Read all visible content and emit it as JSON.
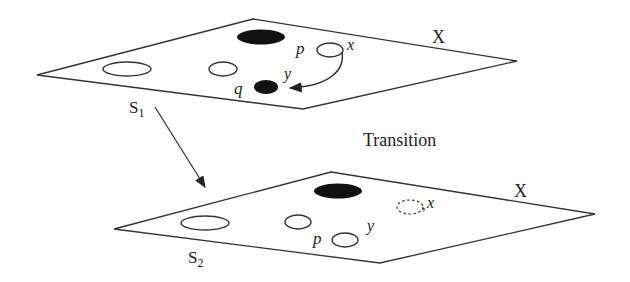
{
  "diagram": {
    "transition_label": "Transition",
    "top_plane": {
      "space_label": "X",
      "state_label": "S",
      "state_subscript": "1",
      "points": {
        "p": "p",
        "x": "x",
        "y": "y",
        "q": "q"
      }
    },
    "bottom_plane": {
      "space_label": "X",
      "state_label": "S",
      "state_subscript": "2",
      "points": {
        "p": "p",
        "x": "x",
        "y": "y"
      }
    },
    "colors": {
      "stroke": "#222222",
      "fill_dark": "#111111",
      "background": "#ffffff"
    }
  }
}
